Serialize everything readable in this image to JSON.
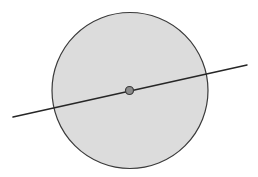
{
  "canvas": {
    "width": 258,
    "height": 177,
    "background_color": "#ffffff"
  },
  "figure": {
    "title": "",
    "shapes": [
      {
        "name": "circle",
        "type": "circle",
        "cx": 130,
        "cy": 90.5,
        "r": 78,
        "fill_color": "#dcdcdc",
        "stroke_color": "#3a3a3a",
        "stroke_width": 1.2,
        "label": ""
      },
      {
        "name": "diameter-line",
        "type": "line",
        "x1": 13,
        "y1": 117,
        "x2": 247,
        "y2": 65,
        "stroke_color": "#262626",
        "stroke_width": 1.5,
        "label": ""
      },
      {
        "name": "center-point",
        "type": "point",
        "cx": 129.5,
        "cy": 90.5,
        "r": 4,
        "fill_color": "#8c8c8c",
        "stroke_color": "#3a3a3a",
        "stroke_width": 1.2,
        "label": ""
      }
    ]
  },
  "chart_data": {
    "type": "scatter",
    "title": "",
    "xlabel": "",
    "ylabel": "",
    "annotations": [
      "shaded circle, radius 78 px, centered at (130, 90.5)",
      "straight line through the circle center, from (13, 117) to (247, 65)",
      "marked center point at (129.5, 90.5)"
    ],
    "legend": [],
    "grid": false
  }
}
